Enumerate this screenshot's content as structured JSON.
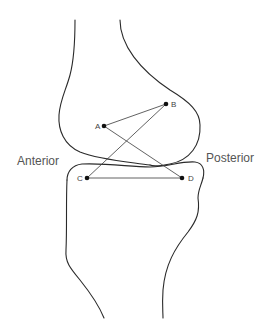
{
  "diagram": {
    "type": "knee-joint-lateral-view",
    "labels": {
      "anterior": "Anterior",
      "posterior": "Posterior"
    },
    "points": [
      {
        "id": "A",
        "label": "A",
        "x": 104,
        "y": 126
      },
      {
        "id": "B",
        "label": "B",
        "x": 166,
        "y": 104
      },
      {
        "id": "C",
        "label": "C",
        "x": 87,
        "y": 178
      },
      {
        "id": "D",
        "label": "D",
        "x": 182,
        "y": 178
      }
    ],
    "links": [
      {
        "from": "A",
        "to": "B"
      },
      {
        "from": "A",
        "to": "D"
      },
      {
        "from": "B",
        "to": "C"
      },
      {
        "from": "C",
        "to": "D"
      }
    ],
    "colors": {
      "line": "#2a2a2a",
      "text": "#555555",
      "background": "#ffffff"
    }
  }
}
